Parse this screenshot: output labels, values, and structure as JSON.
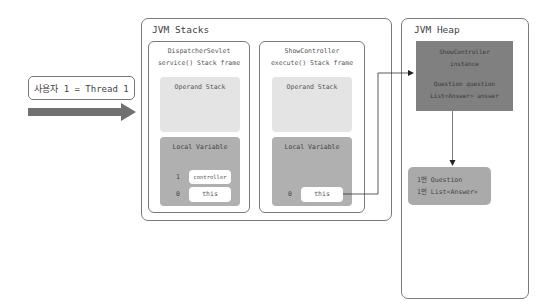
{
  "thread": {
    "label": "사용자 1 = Thread 1",
    "arrow_color": "#707070"
  },
  "jvm_stacks": {
    "title": "JVM Stacks",
    "frames": [
      {
        "title_line1": "DispatcherSevlet",
        "title_line2": "service() Stack frame",
        "operand_stack": "Operand Stack",
        "local_variable": "Local Variable",
        "slots": [
          {
            "index": "1",
            "value": "controller"
          },
          {
            "index": "0",
            "value": "this"
          }
        ]
      },
      {
        "title_line1": "ShowController",
        "title_line2": "execute() Stack frame",
        "operand_stack": "Operand Stack",
        "local_variable": "Local Variable",
        "slots": [
          {
            "index": "0",
            "value": "this"
          }
        ]
      }
    ]
  },
  "jvm_heap": {
    "title": "JVM Heap",
    "instance": {
      "line1": "ShowController",
      "line2": "instance",
      "line3": "Question question",
      "line4": "List<Answer> answer"
    },
    "referenced": {
      "line1": "1번 Question",
      "line2": "1번 List<Answer>"
    }
  },
  "colors": {
    "operand_bg": "#e4e4e4",
    "local_bg": "#b0b0b0",
    "instance_bg": "#808080",
    "question_bg": "#aaaaaa",
    "border": "#7a7a7a"
  }
}
